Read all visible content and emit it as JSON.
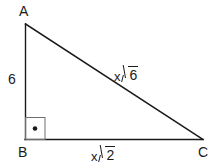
{
  "figure": {
    "type": "right-triangle",
    "title": "",
    "background_color": "#ffffff",
    "stroke_color": "#1a1a1a",
    "vertices": [
      {
        "name": "A",
        "label": "A",
        "x": 25,
        "y": 24
      },
      {
        "name": "B",
        "label": "B",
        "x": 25,
        "y": 139
      },
      {
        "name": "C",
        "label": "C",
        "x": 203,
        "y": 139
      }
    ],
    "right_angle": {
      "at_vertex": "B",
      "marker": "square-with-dot",
      "size": 20
    },
    "sides": [
      {
        "name": "leg-AB",
        "from": "A",
        "to": "B",
        "label": "6",
        "label_coefficient": "6",
        "label_radicand": ""
      },
      {
        "name": "hypotenuse-AC",
        "from": "A",
        "to": "C",
        "label": "x√6",
        "label_coefficient": "x",
        "label_radicand": "6"
      },
      {
        "name": "base-BC",
        "from": "B",
        "to": "C",
        "label": "x√2",
        "label_coefficient": "x",
        "label_radicand": "2"
      }
    ]
  },
  "labels": {
    "vertex_a": "A",
    "vertex_b": "B",
    "vertex_c": "C",
    "leg_ab": "6",
    "hyp_coefficient": "x",
    "hyp_radicand": "6",
    "base_coefficient": "x",
    "base_radicand": "2"
  }
}
